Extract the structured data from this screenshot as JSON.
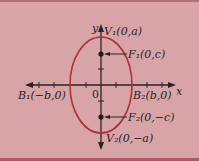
{
  "diagram": {
    "axes": {
      "x_label": "x",
      "y_label": "y",
      "origin_label": "0"
    },
    "points": {
      "V1": "V₁(0,a)",
      "V2": "V₂(0,−a)",
      "F1": "F₁(0,c)",
      "F2": "F₂(0,−c)",
      "B1": "B₁(−b,0)",
      "B2": "B₂(b,0)"
    },
    "colors": {
      "background": "#d9a4a8",
      "ellipse": "#a8323c",
      "axes": "#2a2224"
    }
  }
}
